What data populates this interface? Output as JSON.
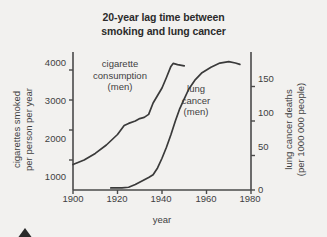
{
  "chart_data": {
    "type": "line",
    "title": "20-year lag time between smoking and lung cancer",
    "title_lines": [
      "20-year lag time between",
      "smoking and lung cancer"
    ],
    "xlabel": "year",
    "xlim": [
      1900,
      1980
    ],
    "xticks": [
      1900,
      1920,
      1940,
      1960,
      1980
    ],
    "xticklabels": [
      "1900",
      "1920",
      "1940",
      "1960",
      "1980"
    ],
    "grid": false,
    "legend": "inline-annotations",
    "axes": [
      {
        "side": "left",
        "ylabel": "cigarettes smoked per person per year",
        "ylabel_lines": [
          "cigarettes smoked",
          "per person per year"
        ],
        "ylim": [
          0,
          4600
        ],
        "yticks": [
          1000,
          2000,
          3000,
          4000
        ],
        "yticklabels": [
          "1000",
          "2000",
          "3000",
          "4000"
        ]
      },
      {
        "side": "right",
        "ylabel": "lung cancer deaths (per 1000 000 people)",
        "ylabel_lines": [
          "lung cancer deaths",
          "(per 1000 000 people)"
        ],
        "ylim": [
          0,
          200
        ],
        "yticks": [
          0,
          50,
          100,
          150
        ],
        "yticklabels": [
          "0",
          "50",
          "100",
          "150"
        ]
      }
    ],
    "series": [
      {
        "name": "cigarette consumption (men)",
        "label_lines": [
          "cigarette",
          "consumption",
          "(men)"
        ],
        "axis": "left",
        "color": "#3a3a3a",
        "points": [
          [
            1900,
            850
          ],
          [
            1905,
            1000
          ],
          [
            1910,
            1220
          ],
          [
            1915,
            1500
          ],
          [
            1920,
            1850
          ],
          [
            1923,
            2150
          ],
          [
            1925,
            2220
          ],
          [
            1928,
            2300
          ],
          [
            1930,
            2380
          ],
          [
            1932,
            2420
          ],
          [
            1934,
            2520
          ],
          [
            1936,
            2900
          ],
          [
            1938,
            3150
          ],
          [
            1940,
            3400
          ],
          [
            1942,
            3750
          ],
          [
            1944,
            4120
          ],
          [
            1945,
            4220
          ],
          [
            1947,
            4180
          ],
          [
            1950,
            4140
          ]
        ]
      },
      {
        "name": "lung cancer (men)",
        "label_lines": [
          "lung",
          "cancer",
          "(men)"
        ],
        "axis": "right",
        "color": "#3a3a3a",
        "points": [
          [
            1917,
            3
          ],
          [
            1922,
            3
          ],
          [
            1925,
            4
          ],
          [
            1928,
            8
          ],
          [
            1931,
            13
          ],
          [
            1934,
            18
          ],
          [
            1936,
            22
          ],
          [
            1938,
            32
          ],
          [
            1940,
            46
          ],
          [
            1942,
            62
          ],
          [
            1944,
            80
          ],
          [
            1946,
            100
          ],
          [
            1948,
            118
          ],
          [
            1950,
            132
          ],
          [
            1952,
            146
          ],
          [
            1955,
            160
          ],
          [
            1958,
            170
          ],
          [
            1962,
            178
          ],
          [
            1966,
            184
          ],
          [
            1970,
            186
          ],
          [
            1973,
            184
          ],
          [
            1975,
            182
          ]
        ]
      }
    ]
  },
  "annotations": {
    "cigarette_label": [
      "cigarette",
      "consumption",
      "(men)"
    ],
    "lung_label": [
      "lung",
      "cancer",
      "(men)"
    ]
  },
  "colors": {
    "background": "#f2f1ef",
    "ink": "#3a3a3a",
    "title": "#2b2b2b",
    "caret": "#2a2a2a"
  }
}
